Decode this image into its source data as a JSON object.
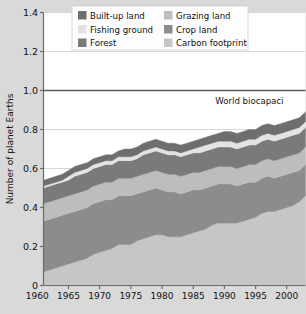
{
  "chart_data": {
    "type": "area",
    "title": "",
    "xlabel": "",
    "ylabel": "Number of planet Earths",
    "xlim": [
      1961,
      2003
    ],
    "ylim": [
      0,
      1.4
    ],
    "grid": true,
    "legend_position": "top-center",
    "xticks": [
      "1960",
      "1965",
      "1970",
      "1975",
      "1980",
      "1985",
      "1990",
      "1995",
      "2000"
    ],
    "xtick_values": [
      1960,
      1965,
      1970,
      1975,
      1980,
      1985,
      1990,
      1995,
      2000
    ],
    "yticks": [
      "0",
      "0.2",
      "0.4",
      "0.6",
      "0.8",
      "1.0",
      "1.2",
      "1.4"
    ],
    "ytick_values": [
      0,
      0.2,
      0.4,
      0.6,
      0.8,
      1.0,
      1.2,
      1.4
    ],
    "annotations": [
      {
        "text": "World biocapaci",
        "x": 1994,
        "y": 0.93,
        "note": "label clipped at image edge; reads 'World biocapacity'"
      }
    ],
    "reference_lines": [
      {
        "value": 1.0,
        "label": "World biocapacity",
        "color": "#595959"
      }
    ],
    "x": [
      1961,
      1962,
      1963,
      1964,
      1965,
      1966,
      1967,
      1968,
      1969,
      1970,
      1971,
      1972,
      1973,
      1974,
      1975,
      1976,
      1977,
      1978,
      1979,
      1980,
      1981,
      1982,
      1983,
      1984,
      1985,
      1986,
      1987,
      1988,
      1989,
      1990,
      1991,
      1992,
      1993,
      1994,
      1995,
      1996,
      1997,
      1998,
      1999,
      2000,
      2001,
      2002,
      2003
    ],
    "series": [
      {
        "name": "Carbon footprint",
        "color": "#c6c6c6",
        "values": [
          0.07,
          0.08,
          0.09,
          0.1,
          0.11,
          0.12,
          0.13,
          0.14,
          0.16,
          0.17,
          0.18,
          0.19,
          0.21,
          0.21,
          0.21,
          0.23,
          0.24,
          0.25,
          0.26,
          0.26,
          0.25,
          0.25,
          0.25,
          0.26,
          0.27,
          0.28,
          0.29,
          0.31,
          0.32,
          0.32,
          0.32,
          0.32,
          0.33,
          0.34,
          0.35,
          0.37,
          0.38,
          0.38,
          0.39,
          0.4,
          0.41,
          0.43,
          0.46
        ]
      },
      {
        "name": "Crop land",
        "color": "#8c8c8c",
        "values": [
          0.26,
          0.26,
          0.26,
          0.26,
          0.26,
          0.26,
          0.26,
          0.26,
          0.26,
          0.26,
          0.26,
          0.25,
          0.25,
          0.25,
          0.25,
          0.24,
          0.24,
          0.24,
          0.24,
          0.23,
          0.23,
          0.23,
          0.22,
          0.22,
          0.22,
          0.21,
          0.21,
          0.2,
          0.2,
          0.2,
          0.2,
          0.19,
          0.19,
          0.19,
          0.18,
          0.18,
          0.18,
          0.17,
          0.17,
          0.17,
          0.17,
          0.16,
          0.16
        ]
      },
      {
        "name": "Grazing land",
        "color": "#bdbdbd",
        "values": [
          0.09,
          0.09,
          0.09,
          0.09,
          0.09,
          0.09,
          0.09,
          0.09,
          0.09,
          0.09,
          0.09,
          0.09,
          0.09,
          0.09,
          0.09,
          0.09,
          0.09,
          0.09,
          0.09,
          0.09,
          0.09,
          0.09,
          0.09,
          0.09,
          0.09,
          0.09,
          0.09,
          0.09,
          0.09,
          0.09,
          0.09,
          0.09,
          0.09,
          0.09,
          0.09,
          0.09,
          0.09,
          0.09,
          0.09,
          0.09,
          0.09,
          0.09,
          0.09
        ]
      },
      {
        "name": "Forest",
        "color": "#7a7a7a",
        "values": [
          0.08,
          0.08,
          0.08,
          0.08,
          0.08,
          0.09,
          0.09,
          0.09,
          0.09,
          0.09,
          0.09,
          0.09,
          0.09,
          0.09,
          0.09,
          0.09,
          0.1,
          0.1,
          0.1,
          0.1,
          0.1,
          0.1,
          0.1,
          0.1,
          0.1,
          0.1,
          0.1,
          0.1,
          0.1,
          0.1,
          0.1,
          0.1,
          0.1,
          0.1,
          0.1,
          0.1,
          0.1,
          0.1,
          0.1,
          0.1,
          0.1,
          0.1,
          0.1
        ]
      },
      {
        "name": "Fishing ground",
        "color": "#e3e3e3",
        "values": [
          0.01,
          0.01,
          0.01,
          0.01,
          0.02,
          0.02,
          0.02,
          0.02,
          0.02,
          0.02,
          0.02,
          0.02,
          0.02,
          0.02,
          0.02,
          0.02,
          0.02,
          0.02,
          0.02,
          0.02,
          0.02,
          0.02,
          0.02,
          0.02,
          0.02,
          0.03,
          0.03,
          0.03,
          0.03,
          0.03,
          0.03,
          0.03,
          0.03,
          0.03,
          0.03,
          0.03,
          0.03,
          0.03,
          0.03,
          0.03,
          0.03,
          0.03,
          0.03
        ]
      },
      {
        "name": "Built-up land",
        "color": "#6e6e6e",
        "values": [
          0.03,
          0.03,
          0.03,
          0.03,
          0.03,
          0.03,
          0.03,
          0.03,
          0.03,
          0.03,
          0.03,
          0.03,
          0.03,
          0.04,
          0.04,
          0.04,
          0.04,
          0.04,
          0.04,
          0.04,
          0.04,
          0.04,
          0.04,
          0.04,
          0.04,
          0.04,
          0.04,
          0.04,
          0.04,
          0.05,
          0.05,
          0.05,
          0.05,
          0.05,
          0.05,
          0.05,
          0.05,
          0.05,
          0.05,
          0.05,
          0.05,
          0.05,
          0.05
        ]
      }
    ],
    "totals": [
      0.54,
      0.55,
      0.56,
      0.57,
      0.59,
      0.61,
      0.62,
      0.63,
      0.65,
      0.66,
      0.67,
      0.67,
      0.69,
      0.7,
      0.7,
      0.71,
      0.73,
      0.74,
      0.75,
      0.74,
      0.73,
      0.73,
      0.72,
      0.73,
      0.74,
      0.75,
      0.76,
      0.77,
      0.78,
      0.79,
      0.79,
      0.78,
      0.79,
      0.8,
      0.8,
      0.82,
      0.83,
      0.82,
      0.83,
      0.84,
      0.85,
      0.86,
      0.89
    ]
  },
  "legend": {
    "items": [
      {
        "label": "Built-up land",
        "color": "#6e6e6e"
      },
      {
        "label": "Grazing land",
        "color": "#bdbdbd"
      },
      {
        "label": "Fishing ground",
        "color": "#e3e3e3"
      },
      {
        "label": "Crop land",
        "color": "#8c8c8c"
      },
      {
        "label": "Forest",
        "color": "#7a7a7a"
      },
      {
        "label": "Carbon footprint",
        "color": "#c6c6c6"
      }
    ]
  },
  "colors": {
    "figure_background": "#d9d9d9",
    "plot_background": "#ffffff",
    "axis": "#6b6b6b",
    "grid": "#d6d6d6",
    "text": "#111111",
    "biocapacity_line": "#595959"
  }
}
